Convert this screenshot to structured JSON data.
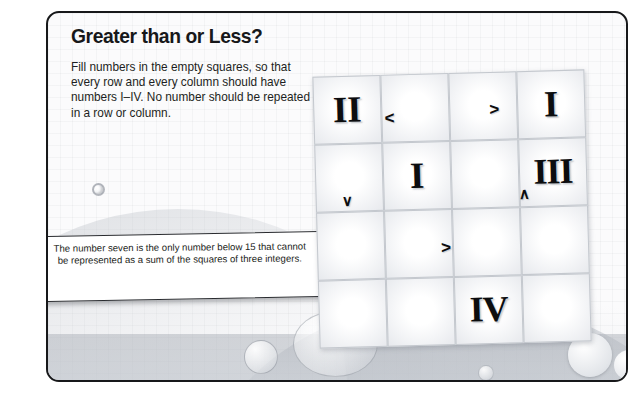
{
  "page": {
    "title": "Greater than or Less?",
    "description": "Fill numbers in the empty squares, so that every row and every column should have numbers I–IV. No number should be repeated in a row or column."
  },
  "callout": {
    "text": "The number seven is the only number below 15 that cannot be represented as a sum of the squares of three integers."
  },
  "puzzle": {
    "size": 4,
    "allowed_values": [
      "I",
      "II",
      "III",
      "IV"
    ],
    "cells": [
      {
        "row": 1,
        "col": 1,
        "value": "II"
      },
      {
        "row": 1,
        "col": 2,
        "value": ""
      },
      {
        "row": 1,
        "col": 3,
        "value": ""
      },
      {
        "row": 1,
        "col": 4,
        "value": "I"
      },
      {
        "row": 2,
        "col": 1,
        "value": ""
      },
      {
        "row": 2,
        "col": 2,
        "value": "I"
      },
      {
        "row": 2,
        "col": 3,
        "value": ""
      },
      {
        "row": 2,
        "col": 4,
        "value": "III"
      },
      {
        "row": 3,
        "col": 1,
        "value": ""
      },
      {
        "row": 3,
        "col": 2,
        "value": ""
      },
      {
        "row": 3,
        "col": 3,
        "value": ""
      },
      {
        "row": 3,
        "col": 4,
        "value": ""
      },
      {
        "row": 4,
        "col": 1,
        "value": ""
      },
      {
        "row": 4,
        "col": 2,
        "value": ""
      },
      {
        "row": 4,
        "col": 3,
        "value": "IV"
      },
      {
        "row": 4,
        "col": 4,
        "value": ""
      }
    ],
    "operators": [
      {
        "id": "r1-c1c2",
        "glyph": "<",
        "orientation": "horizontal",
        "between": "r1c1-r1c2"
      },
      {
        "id": "r1-c3c4",
        "glyph": ">",
        "orientation": "horizontal",
        "between": "r1c3-r1c4"
      },
      {
        "id": "r2c1-r3c1",
        "glyph": "∨",
        "orientation": "vertical",
        "between": "r2c1-r3c1"
      },
      {
        "id": "r2c4-r3c4",
        "glyph": "∧",
        "orientation": "vertical",
        "between": "r2c4-r3c4"
      },
      {
        "id": "r3-c2c3",
        "glyph": ">",
        "orientation": "horizontal",
        "between": "r3c2-r3c3"
      }
    ]
  },
  "colors": {
    "frame_border": "#17181a",
    "page_background": "#fbfbfc",
    "grid_line": "#c4c8ce",
    "text": "#17181a",
    "callout_border": "#2a2c30"
  }
}
